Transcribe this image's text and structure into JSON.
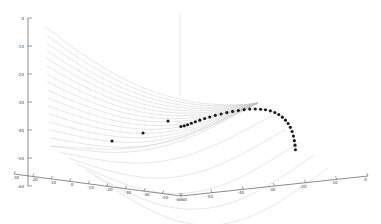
{
  "figure": {
    "title": "",
    "background_color": "#ffffff",
    "axis_color": "#5a5a5a",
    "mesh_color": "#bdbdc2",
    "marker_color": "#1b1b24"
  },
  "chart_data": {
    "type": "line",
    "title": "",
    "subtitle": "",
    "projection": "3d-surface-mesh",
    "xlabel": "",
    "ylabel": "",
    "zlabel": "",
    "grid": false,
    "legend": "none",
    "legend_entries": [],
    "annotations": [],
    "axes": {
      "z_axis": {
        "name": "vertical-axis",
        "ticks": [
          0,
          -10,
          -20,
          -30,
          -40,
          -50,
          -60
        ],
        "tick_labels": [
          "0",
          "-10",
          "-20",
          "-30",
          "-40",
          "-50",
          "-60"
        ],
        "range": [
          -60,
          0
        ],
        "position": "left"
      },
      "x_axis": {
        "name": "bottom-left-axis",
        "ticks": [
          30,
          20,
          10,
          0,
          -10,
          -20,
          -30,
          -40,
          -50,
          -60
        ],
        "tick_labels": [
          "30",
          "20",
          "10",
          "0",
          "-10",
          "-20",
          "-30",
          "-40",
          "-50",
          "-60"
        ],
        "range": [
          -60,
          30
        ],
        "position": "bottom-left"
      },
      "y_axis": {
        "name": "bottom-right-axis",
        "ticks": [
          -60,
          -50,
          -40,
          -30,
          -20,
          -10,
          0
        ],
        "tick_labels": [
          "-60",
          "-50",
          "-40",
          "-30",
          "-20",
          "-10",
          "0"
        ],
        "range": [
          -60,
          0
        ],
        "position": "bottom-right"
      }
    },
    "series": [
      {
        "name": "surface-mesh-family",
        "style": "faint-gray-curves",
        "curve_count": 16,
        "description": "family of nested parabolic curves forming a saddle surface"
      },
      {
        "name": "optimization-path-markers",
        "style": "black-filled-circles",
        "marker_count": 30,
        "x": [
          -0.5,
          1.0,
          2.5,
          4.2,
          6.0,
          8.0,
          10.2,
          12.5,
          15.0,
          17.6,
          20.2,
          22.8,
          25.4,
          28.0,
          30.5,
          33.0,
          35.4,
          37.6,
          39.8,
          41.8,
          43.6,
          45.2,
          46.6,
          47.8,
          48.8,
          49.6,
          50.2,
          50.6,
          50.9,
          51.1
        ],
        "y": [
          -41.0,
          -40.6,
          -40.0,
          -39.2,
          -38.4,
          -37.5,
          -36.6,
          -35.7,
          -34.8,
          -34.0,
          -33.2,
          -32.5,
          -31.9,
          -31.4,
          -31.0,
          -30.8,
          -30.8,
          -31.0,
          -31.4,
          -32.1,
          -33.0,
          -34.2,
          -35.6,
          -37.2,
          -39.0,
          -41.0,
          -43.2,
          -45.4,
          -47.6,
          -49.8
        ]
      }
    ]
  }
}
